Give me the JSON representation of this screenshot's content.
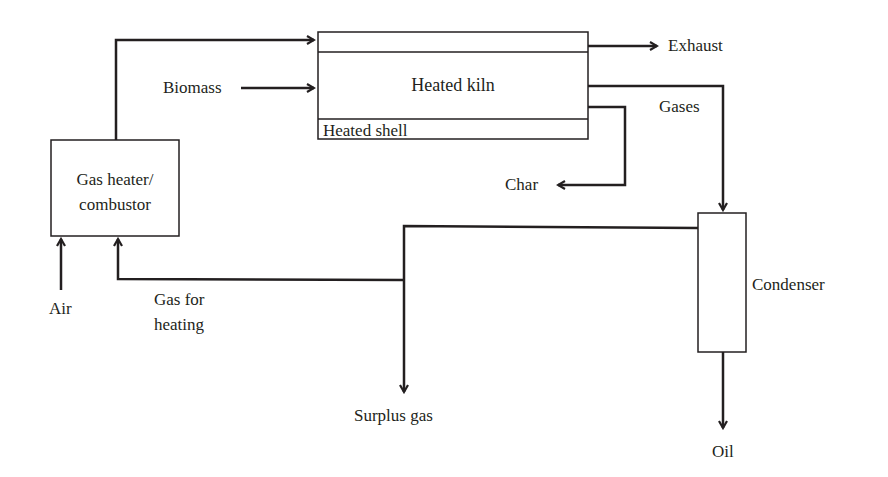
{
  "diagram": {
    "type": "process-flow",
    "nodes": {
      "gas_heater": {
        "label_line1": "Gas heater/",
        "label_line2": "combustor"
      },
      "kiln": {
        "label": "Heated kiln",
        "shell_label": "Heated shell"
      },
      "condenser": {
        "label": "Condenser"
      }
    },
    "streams": {
      "biomass": "Biomass",
      "exhaust": "Exhaust",
      "gases": "Gases",
      "char": "Char",
      "air": "Air",
      "gas_for_heating_line1": "Gas for",
      "gas_for_heating_line2": "heating",
      "surplus_gas": "Surplus gas",
      "oil": "Oil"
    },
    "edges": [
      {
        "from": "gas_heater",
        "to": "kiln",
        "label": ""
      },
      {
        "from": "biomass",
        "to": "kiln",
        "label": "Biomass"
      },
      {
        "from": "kiln",
        "to": "exhaust",
        "label": "Exhaust"
      },
      {
        "from": "kiln",
        "to": "condenser",
        "label": "Gases"
      },
      {
        "from": "kiln",
        "to": "char",
        "label": "Char"
      },
      {
        "from": "condenser",
        "to": "oil",
        "label": "Oil"
      },
      {
        "from": "condenser",
        "to": "surplus_gas",
        "label": "Surplus gas"
      },
      {
        "from": "condenser",
        "to": "gas_heater",
        "label": "Gas for heating"
      },
      {
        "from": "air",
        "to": "gas_heater",
        "label": "Air"
      }
    ],
    "colors": {
      "stroke": "#231f20",
      "background": "#ffffff"
    }
  }
}
